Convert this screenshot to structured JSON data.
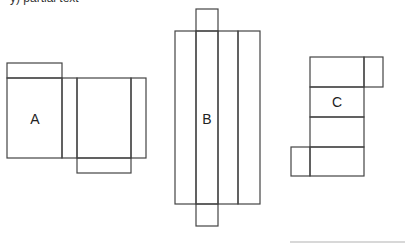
{
  "header": {
    "fragment": "y) partial text"
  },
  "nets": [
    {
      "label": "A"
    },
    {
      "label": "B"
    },
    {
      "label": "C"
    }
  ],
  "colors": {
    "stroke": "#444444",
    "background": "#ffffff"
  }
}
